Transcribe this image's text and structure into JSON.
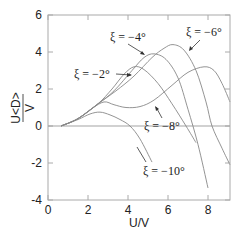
{
  "chart_data": {
    "type": "line",
    "title": "",
    "xlabel": "U/V",
    "ylabel": "U<D>/V",
    "xlim": [
      0,
      9.1
    ],
    "ylim": [
      -4,
      6
    ],
    "xticks": [
      0,
      2,
      4,
      6,
      8
    ],
    "yticks": [
      -4,
      -2,
      0,
      2,
      4,
      6
    ],
    "xtick_labels": [
      "0",
      "2",
      "4",
      "6",
      "8"
    ],
    "ytick_labels": [
      "-4",
      "-2",
      "0",
      "2",
      "4",
      "6"
    ],
    "grid": false,
    "zero_line": true,
    "series": [
      {
        "name": "ξ = −2°",
        "points": [
          [
            0.65,
            0
          ],
          [
            1.5,
            0.4
          ],
          [
            2.5,
            1.2
          ],
          [
            3.2,
            2.0
          ],
          [
            3.8,
            2.8
          ],
          [
            4.3,
            3.2
          ],
          [
            4.8,
            3.05
          ],
          [
            5.5,
            2.3
          ],
          [
            6.2,
            1.2
          ],
          [
            6.9,
            0
          ],
          [
            7.4,
            -0.9
          ]
        ]
      },
      {
        "name": "ξ = −4°",
        "points": [
          [
            0.65,
            0
          ],
          [
            1.5,
            0.4
          ],
          [
            2.5,
            1.2
          ],
          [
            3.3,
            1.9
          ],
          [
            4.2,
            3.0
          ],
          [
            4.8,
            3.7
          ],
          [
            5.3,
            3.9
          ],
          [
            5.9,
            3.6
          ],
          [
            6.5,
            2.6
          ],
          [
            7.0,
            0.9
          ],
          [
            7.5,
            -1.0
          ],
          [
            8.0,
            -3.35
          ]
        ]
      },
      {
        "name": "ξ = −6°",
        "points": [
          [
            0.65,
            0
          ],
          [
            1.5,
            0.4
          ],
          [
            2.5,
            1.2
          ],
          [
            3.4,
            1.9
          ],
          [
            4.3,
            2.7
          ],
          [
            5.2,
            3.7
          ],
          [
            5.8,
            4.2
          ],
          [
            6.25,
            4.4
          ],
          [
            6.8,
            4.1
          ],
          [
            7.4,
            3.0
          ],
          [
            7.9,
            1.3
          ],
          [
            8.2,
            0
          ],
          [
            8.7,
            -1.2
          ],
          [
            9.1,
            -2.1
          ]
        ]
      },
      {
        "name": "ξ = −8°",
        "points": [
          [
            0.65,
            0
          ],
          [
            1.5,
            0.4
          ],
          [
            2.2,
            0.95
          ],
          [
            2.8,
            1.3
          ],
          [
            3.3,
            1.15
          ],
          [
            3.9,
            1.0
          ],
          [
            4.6,
            1.05
          ],
          [
            5.3,
            1.4
          ],
          [
            6.2,
            2.2
          ],
          [
            7.0,
            2.9
          ],
          [
            7.8,
            3.2
          ],
          [
            8.3,
            3.0
          ],
          [
            8.7,
            2.3
          ],
          [
            9.1,
            1.3
          ]
        ]
      },
      {
        "name": "ξ = −10°",
        "points": [
          [
            0.65,
            0
          ],
          [
            1.5,
            0.35
          ],
          [
            2.1,
            0.65
          ],
          [
            2.6,
            0.75
          ],
          [
            3.1,
            0.6
          ],
          [
            3.6,
            0.35
          ],
          [
            4.1,
            0
          ],
          [
            4.6,
            -0.7
          ],
          [
            5.2,
            -1.95
          ]
        ]
      }
    ],
    "annotations": [
      {
        "text": "ξ = −2°",
        "arrow_to": [
          4.2,
          3.1
        ]
      },
      {
        "text": "ξ = −4°",
        "arrow_to": [
          5.0,
          3.8
        ]
      },
      {
        "text": "ξ = −6°",
        "arrow_to": [
          6.7,
          4.2
        ]
      },
      {
        "text": "ξ = −8°",
        "arrow_to": [
          4.5,
          1.05
        ]
      },
      {
        "text": "ξ = −10°",
        "arrow_to": [
          4.6,
          -0.7
        ]
      }
    ]
  },
  "labels": {
    "x_axis": "U/V",
    "y_axis_num": "U<D>",
    "y_axis_den": "V",
    "ann_m2": "ξ = −2°",
    "ann_m4": "ξ = −4°",
    "ann_m6": "ξ = −6°",
    "ann_m8": "ξ = −8°",
    "ann_m10": "ξ = −10°"
  }
}
